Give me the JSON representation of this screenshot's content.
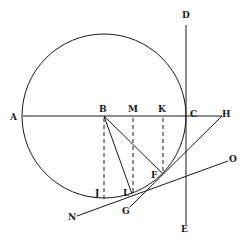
{
  "diagram": {
    "type": "geometric-construction",
    "stroke_color": "#1a1a1a",
    "background": "#ffffff",
    "circle": {
      "cx": 104,
      "cy": 116,
      "r": 82
    },
    "lines": [
      {
        "id": "AH",
        "x1": 23,
        "y1": 116,
        "x2": 222,
        "y2": 116
      },
      {
        "id": "DE",
        "x1": 186,
        "y1": 25,
        "x2": 186,
        "y2": 225
      },
      {
        "id": "HG",
        "x1": 222,
        "y1": 116,
        "x2": 130,
        "y2": 207
      },
      {
        "id": "NO",
        "x1": 77,
        "y1": 216,
        "x2": 228,
        "y2": 161
      },
      {
        "id": "BF",
        "x1": 104,
        "y1": 116,
        "x2": 162,
        "y2": 173
      },
      {
        "id": "BL",
        "x1": 104,
        "y1": 116,
        "x2": 132,
        "y2": 194
      }
    ],
    "dashed_lines": [
      {
        "id": "BJ",
        "x1": 104,
        "y1": 118,
        "x2": 104,
        "y2": 199
      },
      {
        "id": "ML",
        "x1": 133,
        "y1": 118,
        "x2": 133,
        "y2": 194
      },
      {
        "id": "KF",
        "x1": 163,
        "y1": 118,
        "x2": 163,
        "y2": 172
      }
    ],
    "labels": {
      "A": {
        "text": "A",
        "x": 10,
        "y": 120
      },
      "B": {
        "text": "B",
        "x": 99,
        "y": 112
      },
      "M": {
        "text": "M",
        "x": 128,
        "y": 112
      },
      "K": {
        "text": "K",
        "x": 158,
        "y": 112
      },
      "C": {
        "text": "C",
        "x": 190,
        "y": 117
      },
      "H": {
        "text": "H",
        "x": 222,
        "y": 117
      },
      "D": {
        "text": "D",
        "x": 182,
        "y": 18
      },
      "E": {
        "text": "E",
        "x": 181,
        "y": 232
      },
      "O": {
        "text": "O",
        "x": 229,
        "y": 162
      },
      "N": {
        "text": "N",
        "x": 68,
        "y": 220
      },
      "G": {
        "text": "G",
        "x": 122,
        "y": 214
      },
      "F": {
        "text": "F",
        "x": 151,
        "y": 178
      },
      "L": {
        "text": "L",
        "x": 123,
        "y": 196
      },
      "J": {
        "text": "J",
        "x": 95,
        "y": 196
      }
    }
  }
}
